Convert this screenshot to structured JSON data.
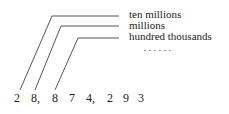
{
  "labels": [
    "ten millions",
    "millions",
    "hundred thousands"
  ],
  "ellipsis": "• • • • • •",
  "digits": [
    "2",
    "8,",
    "8",
    "7",
    "4,",
    "2",
    "9",
    "3"
  ],
  "line_color": "#555555"
}
